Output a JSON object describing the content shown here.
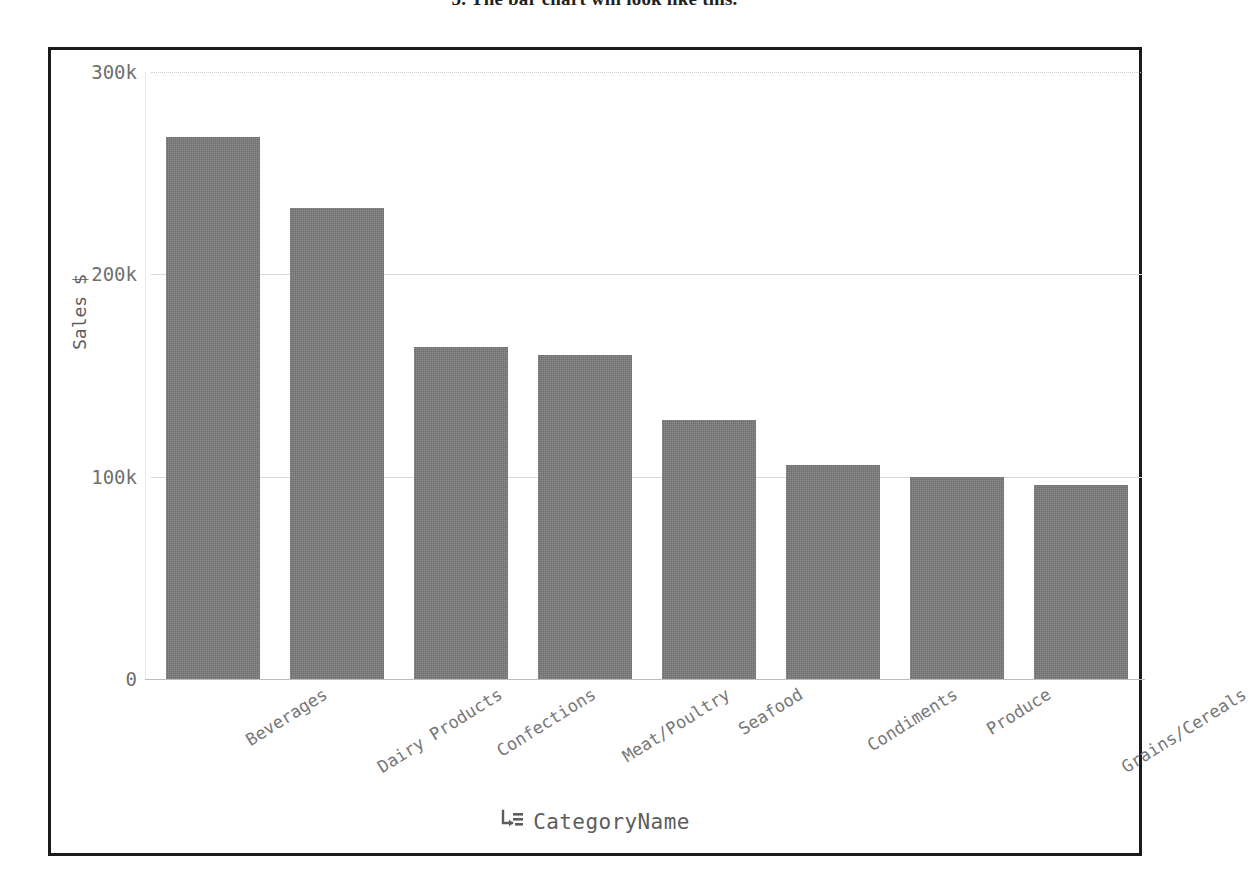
{
  "document": {
    "heading": "5.  The bar chart will look like this."
  },
  "figure": {
    "frame_border_color": "#1b1b1b",
    "background": "#ffffff"
  },
  "axis": {
    "x_title": "CategoryName",
    "x_title_icon": "group-by-icon",
    "y_title": "Sales $"
  },
  "chart_data": {
    "type": "bar",
    "title": "",
    "xlabel": "CategoryName",
    "ylabel": "Sales $",
    "categories": [
      "Beverages",
      "Dairy Products",
      "Confections",
      "Meat/Poultry",
      "Seafood",
      "Condiments",
      "Produce",
      "Grains/Cereals"
    ],
    "values": [
      268000,
      233000,
      164000,
      160000,
      128000,
      106000,
      100000,
      96000
    ],
    "ylim": [
      0,
      310000
    ],
    "yticks": [
      0,
      100000,
      200000,
      300000
    ],
    "ytick_labels": [
      "0",
      "100k",
      "200k",
      "300k"
    ],
    "grid": true,
    "legend": false,
    "bar_color": "#6e6e6e",
    "gridline_color": "#d9d9d9",
    "tick_label_color": "#777777"
  }
}
